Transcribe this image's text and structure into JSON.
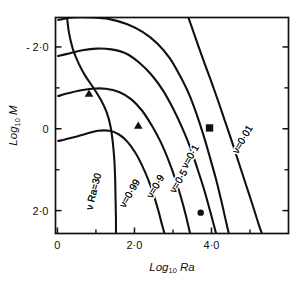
{
  "figure": {
    "background_color": "#ffffff",
    "ink_color": "#111111"
  },
  "chart_data": {
    "type": "line",
    "title": "",
    "subtitle": "",
    "xlabel": "Log10 Ra",
    "ylabel": "Log10 M",
    "xlabel_base": "Log",
    "xlabel_sub": "10",
    "xlabel_var": "Ra",
    "ylabel_base": "Log",
    "ylabel_sub": "10",
    "ylabel_var": "M",
    "xlim": [
      -0.05,
      6.0
    ],
    "ylim": [
      -2.72,
      2.56
    ],
    "grid": false,
    "legend": "inline-curve-labels",
    "legend_position": "inline",
    "xticks": [
      0,
      2.0,
      4.0
    ],
    "xticklabels": [
      "0",
      "2·0",
      "4·0"
    ],
    "xticks_minor": [
      1.0,
      3.0,
      5.0
    ],
    "yticks": [
      2.0,
      0,
      -2.0
    ],
    "yticklabels": [
      "2·0",
      "0",
      "- 2·0"
    ],
    "yticks_minor": [
      1.0,
      -1.0
    ],
    "series": [
      {
        "name": "nu Ra = 30",
        "label": "ν Ra=30",
        "label_x": 1.02,
        "label_y": 1.55,
        "label_rotation": -76,
        "points": [
          [
            0.25,
            -2.72
          ],
          [
            0.3,
            -2.35
          ],
          [
            0.4,
            -1.95
          ],
          [
            0.55,
            -1.6
          ],
          [
            0.72,
            -1.3
          ],
          [
            0.92,
            -1.02
          ],
          [
            1.12,
            -0.72
          ],
          [
            1.28,
            -0.4
          ],
          [
            1.38,
            -0.05
          ],
          [
            1.44,
            0.35
          ],
          [
            1.48,
            0.8
          ],
          [
            1.5,
            1.25
          ],
          [
            1.51,
            1.75
          ],
          [
            1.52,
            2.2
          ],
          [
            1.52,
            2.56
          ]
        ]
      },
      {
        "name": "nu = 0.99",
        "label": "ν=0·99",
        "label_x": 1.95,
        "label_y": 1.62,
        "label_rotation": -60,
        "points": [
          [
            0.02,
            0.3
          ],
          [
            0.2,
            0.26
          ],
          [
            0.45,
            0.2
          ],
          [
            0.75,
            0.12
          ],
          [
            1.05,
            0.05
          ],
          [
            1.35,
            0.05
          ],
          [
            1.6,
            0.14
          ],
          [
            1.82,
            0.32
          ],
          [
            2.02,
            0.58
          ],
          [
            2.2,
            0.9
          ],
          [
            2.36,
            1.25
          ],
          [
            2.5,
            1.62
          ],
          [
            2.62,
            2.0
          ],
          [
            2.72,
            2.36
          ],
          [
            2.78,
            2.56
          ]
        ]
      },
      {
        "name": "nu = 0.9",
        "label": "ν=0·9",
        "label_x": 2.62,
        "label_y": 1.45,
        "label_rotation": -60,
        "points": [
          [
            0.02,
            -0.8
          ],
          [
            0.25,
            -0.86
          ],
          [
            0.55,
            -0.93
          ],
          [
            0.9,
            -0.98
          ],
          [
            1.25,
            -0.98
          ],
          [
            1.6,
            -0.9
          ],
          [
            1.92,
            -0.72
          ],
          [
            2.2,
            -0.44
          ],
          [
            2.45,
            -0.08
          ],
          [
            2.68,
            0.32
          ],
          [
            2.88,
            0.76
          ],
          [
            3.05,
            1.2
          ],
          [
            3.2,
            1.65
          ],
          [
            3.33,
            2.1
          ],
          [
            3.43,
            2.5
          ],
          [
            3.45,
            2.56
          ]
        ]
      },
      {
        "name": "nu = 0.5",
        "label": "ν=0·5",
        "label_x": 3.22,
        "label_y": 1.32,
        "label_rotation": -60,
        "points": [
          [
            0.02,
            -1.78
          ],
          [
            0.3,
            -1.84
          ],
          [
            0.65,
            -1.92
          ],
          [
            1.02,
            -1.96
          ],
          [
            1.4,
            -1.94
          ],
          [
            1.78,
            -1.84
          ],
          [
            2.12,
            -1.62
          ],
          [
            2.44,
            -1.32
          ],
          [
            2.74,
            -0.94
          ],
          [
            3.0,
            -0.5
          ],
          [
            3.24,
            -0.02
          ],
          [
            3.45,
            0.46
          ],
          [
            3.63,
            0.96
          ],
          [
            3.8,
            1.46
          ],
          [
            3.95,
            1.96
          ],
          [
            4.08,
            2.42
          ],
          [
            4.12,
            2.56
          ]
        ]
      },
      {
        "name": "nu = 0.1",
        "label": "ν=0·1",
        "label_x": 3.52,
        "label_y": 0.72,
        "label_rotation": -60,
        "points": [
          [
            0.02,
            -2.66
          ],
          [
            0.4,
            -2.72
          ],
          [
            0.9,
            -2.72
          ],
          [
            1.35,
            -2.68
          ],
          [
            1.8,
            -2.56
          ],
          [
            2.22,
            -2.36
          ],
          [
            2.6,
            -2.08
          ],
          [
            2.92,
            -1.72
          ],
          [
            3.18,
            -1.3
          ],
          [
            3.42,
            -0.84
          ],
          [
            3.62,
            -0.34
          ],
          [
            3.8,
            0.18
          ],
          [
            3.96,
            0.7
          ],
          [
            4.12,
            1.24
          ],
          [
            4.26,
            1.78
          ],
          [
            4.38,
            2.28
          ],
          [
            4.45,
            2.56
          ]
        ]
      },
      {
        "name": "nu = 0.01",
        "label": "ν=0·01",
        "label_x": 4.88,
        "label_y": 0.3,
        "label_rotation": -60,
        "points": [
          [
            3.4,
            -2.72
          ],
          [
            3.52,
            -2.4
          ],
          [
            3.66,
            -2.02
          ],
          [
            3.82,
            -1.6
          ],
          [
            4.0,
            -1.14
          ],
          [
            4.18,
            -0.66
          ],
          [
            4.36,
            -0.16
          ],
          [
            4.54,
            0.34
          ],
          [
            4.72,
            0.86
          ],
          [
            4.9,
            1.38
          ],
          [
            5.08,
            1.9
          ],
          [
            5.24,
            2.38
          ],
          [
            5.31,
            2.56
          ]
        ]
      }
    ],
    "markers": [
      {
        "name": "triangle-1",
        "shape": "triangle",
        "filled": true,
        "x": 0.82,
        "y": -0.86,
        "size": 7
      },
      {
        "name": "triangle-2",
        "shape": "triangle",
        "filled": true,
        "x": 2.1,
        "y": -0.08,
        "size": 7
      },
      {
        "name": "circle-1",
        "shape": "circle",
        "filled": true,
        "x": 3.72,
        "y": 2.05,
        "size": 7
      },
      {
        "name": "square-1",
        "shape": "square",
        "filled": true,
        "x": 3.95,
        "y": -0.02,
        "size": 8
      }
    ]
  }
}
